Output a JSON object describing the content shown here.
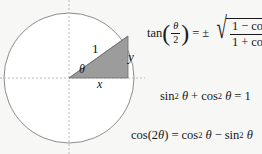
{
  "canvas": {
    "width": 262,
    "height": 154,
    "background_color": "#f7f7f6",
    "ink_color": "#18181a"
  },
  "diagram": {
    "name": "unit-circle-with-right-triangle",
    "circle": {
      "center_x": 69,
      "center_y": 78,
      "radius": 65,
      "stroke_color": "#8d8d8d",
      "fill_color": "#ffffff"
    },
    "axes": {
      "style": "dashed",
      "color": "#b9b9b9",
      "horizontal_y": 78,
      "vertical_x": 69
    },
    "triangle": {
      "fill_color": "#9c9c9c",
      "stroke_color": "#6f6f6f",
      "vertices": [
        [
          69,
          78
        ],
        [
          128,
          78
        ],
        [
          128,
          36
        ]
      ]
    },
    "labels": {
      "hypotenuse": "1",
      "angle": "θ",
      "adjacent": "x",
      "opposite": "y"
    }
  },
  "equations": [
    {
      "id": "half-angle-tangent",
      "text": "tan(θ/2) = ±√((1 − cos θ)/(1 + cos θ))",
      "parts": {
        "fn": "tan",
        "arg_numer": "θ",
        "arg_denom": "2",
        "equals": "=",
        "plusminus": "±",
        "radical_sign": "√",
        "radicand_numer_a": "1",
        "radicand_numer_op": "−",
        "radicand_numer_fn": "cos",
        "radicand_numer_var": "θ",
        "radicand_denom_a": "1",
        "radicand_denom_op": "+",
        "radicand_denom_fn": "cos",
        "radicand_denom_var": "θ",
        "lparen": "(",
        "rparen": ")"
      }
    },
    {
      "id": "pythagorean-identity",
      "text": "sin² θ + cos² θ = 1",
      "parts": {
        "fn1": "sin",
        "sup1": "2",
        "var1": "θ",
        "op": "+",
        "fn2": "cos",
        "sup2": "2",
        "var2": "θ",
        "equals": "=",
        "result": "1"
      }
    },
    {
      "id": "double-angle-cosine",
      "text": "cos(2θ) = cos² θ − sin² θ",
      "parts": {
        "fn": "cos",
        "lparen": "(",
        "coeff": "2",
        "var": "θ",
        "rparen": ")",
        "equals": "=",
        "fn1": "cos",
        "sup1": "2",
        "var1": "θ",
        "op": "−",
        "fn2": "sin",
        "sup2": "2",
        "var2": "θ"
      }
    }
  ]
}
